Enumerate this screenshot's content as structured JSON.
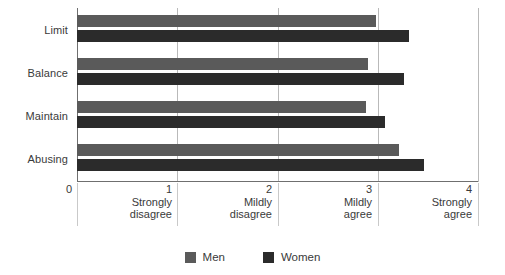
{
  "chart_data": {
    "type": "bar",
    "orientation": "horizontal",
    "title": "",
    "subtitle": "",
    "xlabel": "",
    "ylabel": "",
    "categories": [
      "Limit",
      "Balance",
      "Maintain",
      "Abusing"
    ],
    "series": [
      {
        "name": "Men",
        "color": "#5a5a5a",
        "values": [
          2.98,
          2.9,
          2.88,
          3.21
        ]
      },
      {
        "name": "Women",
        "color": "#2b2b2b",
        "values": [
          3.31,
          3.26,
          3.07,
          3.46
        ]
      }
    ],
    "xlim": [
      0,
      4
    ],
    "xticks": [
      {
        "value": 0,
        "num": "0",
        "line1": "",
        "line2": ""
      },
      {
        "value": 1,
        "num": "1",
        "line1": "Strongly",
        "line2": "disagree"
      },
      {
        "value": 2,
        "num": "2",
        "line1": "Mildly",
        "line2": "disagree"
      },
      {
        "value": 3,
        "num": "3",
        "line1": "Mildly",
        "line2": "agree"
      },
      {
        "value": 4,
        "num": "4",
        "line1": "Strongly",
        "line2": "agree"
      }
    ],
    "grid": true,
    "grid_axis": "x",
    "legend": {
      "position": "bottom",
      "entries": [
        {
          "label": "Men",
          "color": "#5a5a5a"
        },
        {
          "label": "Women",
          "color": "#2b2b2b"
        }
      ]
    }
  },
  "colors": {
    "background": "#ffffff",
    "axis": "#6f6f6f",
    "gridline": "#b9b9b9",
    "text": "#3a3a3a",
    "series_men": "#5a5a5a",
    "series_women": "#2b2b2b"
  }
}
